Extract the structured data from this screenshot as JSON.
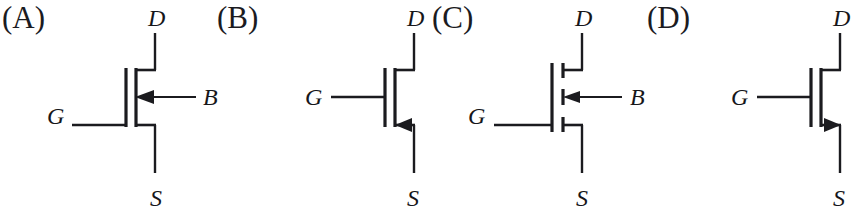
{
  "figure": {
    "width": 858,
    "height": 219,
    "background": "#ffffff",
    "stroke_color": "#1b1b1f",
    "text_color": "#16161a",
    "panel_width": 215
  },
  "panels": [
    {
      "tag": "(A)",
      "tag_x": 2,
      "origin_x": 0,
      "terminals": {
        "drain": "D",
        "gate": "G",
        "source": "S",
        "bulk": "B"
      },
      "has_bulk_terminal": true,
      "bulk_label_visible": true,
      "channel_style": "continuous",
      "arrow_location": "bulk",
      "arrow_direction": "left",
      "arrow_points_inward": true,
      "device_reading": "n-channel depletion-type MOSFET with body terminal",
      "label_positions": {
        "drain_x": 148,
        "drain_y": 6,
        "gate_x": 47,
        "gate_y": 104,
        "source_x": 150,
        "source_y": 186,
        "bulk_x": 203,
        "bulk_y": 88
      }
    },
    {
      "tag": "(B)",
      "tag_x": 2,
      "origin_x": 215,
      "terminals": {
        "drain": "D",
        "gate": "G",
        "source": "S",
        "bulk": ""
      },
      "has_bulk_terminal": false,
      "bulk_label_visible": false,
      "channel_style": "continuous",
      "arrow_location": "source",
      "arrow_direction": "left",
      "arrow_points_inward": true,
      "device_reading": "n-channel MOSFET with source arrow, body tied to source",
      "label_positions": {
        "drain_x": 148,
        "drain_y": 6,
        "gate_x": 90,
        "gate_y": 91,
        "source_x": 148,
        "source_y": 186,
        "bulk_x": 0,
        "bulk_y": 0
      }
    },
    {
      "tag": "(C)",
      "tag_x": 2,
      "origin_x": 430,
      "terminals": {
        "drain": "D",
        "gate": "G",
        "source": "S",
        "bulk": "B"
      },
      "has_bulk_terminal": true,
      "bulk_label_visible": true,
      "channel_style": "broken",
      "arrow_location": "bulk",
      "arrow_direction": "left",
      "arrow_points_inward": true,
      "device_reading": "n-channel enhancement-type MOSFET with body terminal",
      "label_positions": {
        "drain_x": 145,
        "drain_y": 6,
        "gate_x": 38,
        "gate_y": 110,
        "source_x": 146,
        "source_y": 186,
        "bulk_x": 200,
        "bulk_y": 88
      }
    },
    {
      "tag": "(D)",
      "tag_x": 2,
      "origin_x": 645,
      "terminals": {
        "drain": "D",
        "gate": "G",
        "source": "S",
        "bulk": ""
      },
      "has_bulk_terminal": false,
      "bulk_label_visible": false,
      "channel_style": "continuous",
      "arrow_location": "source",
      "arrow_direction": "right",
      "arrow_points_inward": false,
      "device_reading": "p-channel MOSFET with outward source arrow",
      "label_positions": {
        "drain_x": 186,
        "drain_y": 6,
        "gate_x": 86,
        "gate_y": 91,
        "source_x": 186,
        "source_y": 186,
        "bulk_x": 0,
        "bulk_y": 0
      }
    }
  ]
}
